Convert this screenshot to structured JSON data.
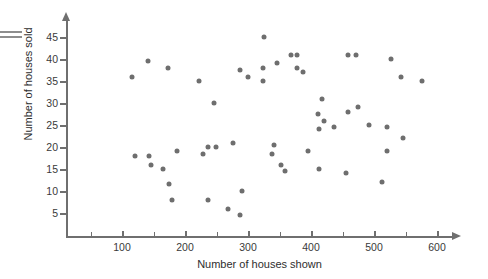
{
  "chart_data": {
    "type": "scatter",
    "title": "",
    "xlabel": "Number of houses shown",
    "ylabel": "Number of houses sold",
    "xlim": [
      0,
      650
    ],
    "ylim": [
      0,
      48
    ],
    "xticks": [
      100,
      200,
      300,
      400,
      500,
      600
    ],
    "xticks_minor": [
      50,
      150,
      250,
      350,
      450,
      550
    ],
    "yticks": [
      5,
      10,
      15,
      20,
      25,
      30,
      35,
      40,
      45
    ],
    "grid": false,
    "legend": null,
    "marker_color": "#6e6e6e",
    "axis_color": "#6f6f6f",
    "points": [
      {
        "x": 116,
        "y": 36
      },
      {
        "x": 141,
        "y": 39.5
      },
      {
        "x": 173,
        "y": 38
      },
      {
        "x": 222,
        "y": 35
      },
      {
        "x": 246,
        "y": 30
      },
      {
        "x": 325,
        "y": 45
      },
      {
        "x": 287,
        "y": 37.5
      },
      {
        "x": 324,
        "y": 38
      },
      {
        "x": 346,
        "y": 39
      },
      {
        "x": 368,
        "y": 41
      },
      {
        "x": 378,
        "y": 41
      },
      {
        "x": 378,
        "y": 38
      },
      {
        "x": 387,
        "y": 37
      },
      {
        "x": 459,
        "y": 41
      },
      {
        "x": 472,
        "y": 41
      },
      {
        "x": 527,
        "y": 40
      },
      {
        "x": 543,
        "y": 36
      },
      {
        "x": 576,
        "y": 35
      },
      {
        "x": 300,
        "y": 36
      },
      {
        "x": 324,
        "y": 35
      },
      {
        "x": 417,
        "y": 31
      },
      {
        "x": 475,
        "y": 29
      },
      {
        "x": 411,
        "y": 27.5
      },
      {
        "x": 420,
        "y": 26
      },
      {
        "x": 437,
        "y": 24.5
      },
      {
        "x": 413,
        "y": 24
      },
      {
        "x": 459,
        "y": 28
      },
      {
        "x": 492,
        "y": 25
      },
      {
        "x": 520,
        "y": 24.5
      },
      {
        "x": 546,
        "y": 22
      },
      {
        "x": 121,
        "y": 18
      },
      {
        "x": 143,
        "y": 18
      },
      {
        "x": 146,
        "y": 16
      },
      {
        "x": 165,
        "y": 15
      },
      {
        "x": 175,
        "y": 11.5
      },
      {
        "x": 179,
        "y": 8
      },
      {
        "x": 187,
        "y": 19
      },
      {
        "x": 228,
        "y": 18.5
      },
      {
        "x": 236,
        "y": 20
      },
      {
        "x": 249,
        "y": 20
      },
      {
        "x": 236,
        "y": 8
      },
      {
        "x": 268,
        "y": 6
      },
      {
        "x": 276,
        "y": 21
      },
      {
        "x": 290,
        "y": 10
      },
      {
        "x": 338,
        "y": 18.5
      },
      {
        "x": 341,
        "y": 20.5
      },
      {
        "x": 352,
        "y": 16
      },
      {
        "x": 358,
        "y": 14.5
      },
      {
        "x": 396,
        "y": 19
      },
      {
        "x": 287,
        "y": 4.5
      },
      {
        "x": 412,
        "y": 15
      },
      {
        "x": 455,
        "y": 14
      },
      {
        "x": 520,
        "y": 19
      },
      {
        "x": 513,
        "y": 12
      }
    ]
  },
  "decoration": {
    "edge_mark": "double-line-mark"
  }
}
